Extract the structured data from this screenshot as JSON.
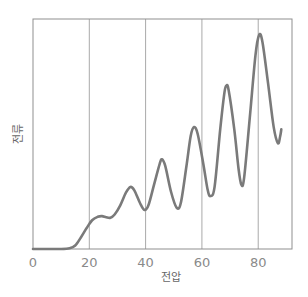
{
  "chart_data": {
    "type": "line",
    "title": "",
    "xlabel": "전압",
    "ylabel": "전류",
    "xlim": [
      0,
      92
    ],
    "ylim": [
      0,
      100
    ],
    "x_ticks": [
      0,
      20,
      40,
      60,
      80
    ],
    "x_tick_labels": [
      "0",
      "20",
      "40",
      "60",
      "80"
    ],
    "grid": "vertical lines at x ticks",
    "legend": "none",
    "series": [
      {
        "name": "current",
        "color": "#7a7a7a",
        "points": [
          [
            0,
            0
          ],
          [
            10,
            0
          ],
          [
            13,
            0.3
          ],
          [
            15,
            1.5
          ],
          [
            17,
            5
          ],
          [
            19,
            9
          ],
          [
            21,
            12.5
          ],
          [
            23,
            14
          ],
          [
            24.5,
            14.3
          ],
          [
            26,
            13.8
          ],
          [
            27.5,
            13.6
          ],
          [
            29,
            15
          ],
          [
            31,
            19
          ],
          [
            33,
            24.5
          ],
          [
            34.6,
            27
          ],
          [
            36,
            25.5
          ],
          [
            38,
            20
          ],
          [
            39.6,
            17
          ],
          [
            41,
            19
          ],
          [
            43,
            28
          ],
          [
            45,
            37
          ],
          [
            45.8,
            39
          ],
          [
            47,
            36
          ],
          [
            49,
            25
          ],
          [
            51,
            18
          ],
          [
            52.5,
            20
          ],
          [
            54.5,
            36
          ],
          [
            56,
            49
          ],
          [
            57.2,
            53
          ],
          [
            58.5,
            50
          ],
          [
            60.5,
            37
          ],
          [
            62,
            26
          ],
          [
            63,
            23
          ],
          [
            64.5,
            27
          ],
          [
            66.5,
            52
          ],
          [
            68,
            68
          ],
          [
            68.7,
            71
          ],
          [
            69.5,
            69
          ],
          [
            71.5,
            52
          ],
          [
            73,
            35
          ],
          [
            74,
            28
          ],
          [
            75,
            31
          ],
          [
            77,
            57
          ],
          [
            79,
            84
          ],
          [
            80.3,
            93
          ],
          [
            81.5,
            90
          ],
          [
            83.5,
            72
          ],
          [
            85.5,
            53
          ],
          [
            87,
            46
          ],
          [
            87.8,
            49
          ],
          [
            88.2,
            52
          ]
        ]
      }
    ]
  }
}
